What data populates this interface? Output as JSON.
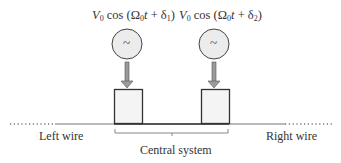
{
  "sources": [
    {
      "formula_prefix": "V",
      "formula_sub0": "0",
      "formula_mid": " cos (Ω",
      "formula_sub1": "0",
      "formula_t": "t",
      "formula_plus": " + δ",
      "formula_sub2": "1",
      "formula_end": ")",
      "symbol": "~"
    },
    {
      "formula_prefix": "V",
      "formula_sub0": "0",
      "formula_mid": " cos (Ω",
      "formula_sub1": "0",
      "formula_t": "t",
      "formula_plus": " + δ",
      "formula_sub2": "2",
      "formula_end": ")",
      "symbol": "~"
    }
  ],
  "labels": {
    "left_wire": "Left wire",
    "right_wire": "Right wire",
    "central_system": "Central system"
  },
  "colors": {
    "circle_fill": "#ececec",
    "box_fill": "#f4f4f4",
    "stroke": "#333333",
    "arrow_fill": "#9a9a9a"
  }
}
